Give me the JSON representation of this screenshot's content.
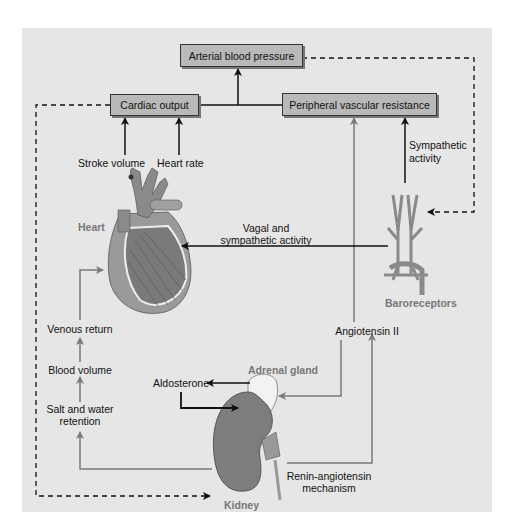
{
  "diagram": {
    "boxes": {
      "arterial_bp": "Arterial blood pressure",
      "cardiac_output": "Cardiac output",
      "peripheral_resistance": "Peripheral vascular resistance"
    },
    "labels": {
      "stroke_volume": "Stroke volume",
      "heart_rate": "Heart rate",
      "sympathetic_activity_line1": "Sympathetic",
      "sympathetic_activity_line2": "activity",
      "vagal_line1": "Vagal and",
      "vagal_line2": "sympathetic activity",
      "venous_return": "Venous return",
      "blood_volume": "Blood volume",
      "salt_water_line1": "Salt and water",
      "salt_water_line2": "retention",
      "aldosterone": "Aldosterone",
      "angiotensin_ii": "Angiotensin II",
      "renin_line1": "Renin-angiotensin",
      "renin_line2": "mechanism"
    },
    "organs": {
      "heart": "Heart",
      "baroreceptors": "Baroreceptors",
      "adrenal_gland": "Adrenal gland",
      "kidney": "Kidney"
    },
    "colors": {
      "panel_bg": "#e6e6e6",
      "box_fill": "#b9b9b9",
      "black_arrow": "#111111",
      "gray_arrow": "#7a7a7a",
      "organ_label": "#777777",
      "kidney": "#7d7d7d",
      "heart": "#8a8a8a"
    }
  }
}
